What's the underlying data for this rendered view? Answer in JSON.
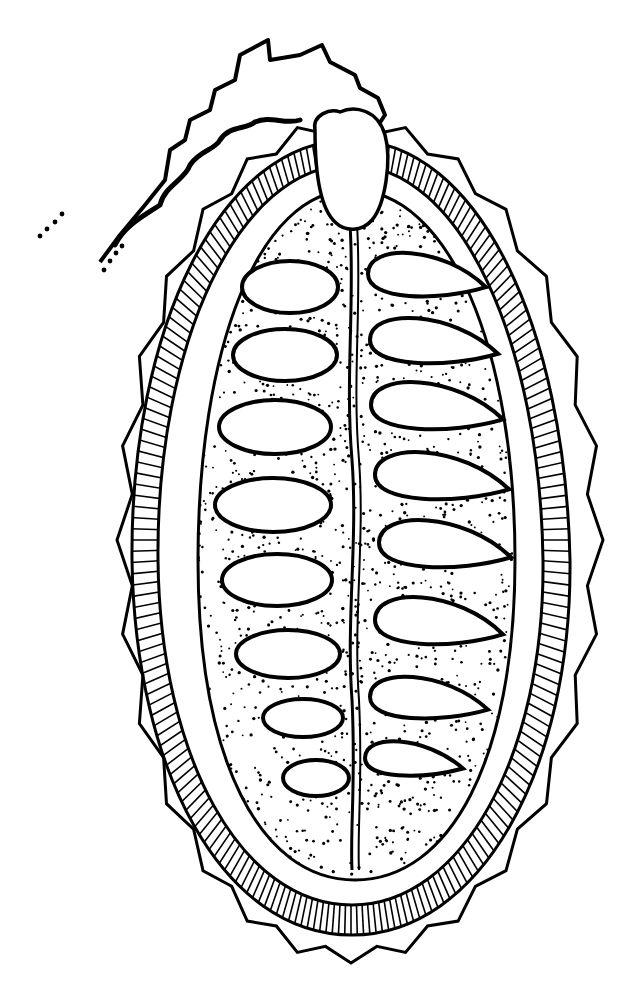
{
  "figure": {
    "style": "black ink line drawing with stippling and hatching",
    "colors": {
      "ink": "#000000",
      "paper": "#ffffff"
    },
    "parts": {
      "style_stalk": "style",
      "outer_wall": "spiny pericarp",
      "hatched_layer": "hatched wall layer",
      "inner_cavity": "stippled locule",
      "septum": "central septum",
      "seeds_left_count": 8,
      "seeds_right_count": 8
    }
  }
}
